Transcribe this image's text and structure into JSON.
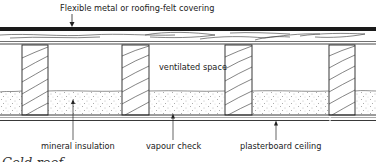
{
  "diagram": {
    "type": "cross-section",
    "labels": {
      "covering": "Flexible metal or roofing-felt covering",
      "ventilated_space": "ventilated space",
      "mineral_insulation": "mineral insulation",
      "vapour_check": "vapour check",
      "plasterboard_ceiling": "plasterboard ceiling"
    },
    "caption": "Cold roof",
    "components": [
      {
        "name": "covering",
        "description": "dark top layer"
      },
      {
        "name": "timber decking",
        "description": "boarding with wood grain"
      },
      {
        "name": "joists",
        "count": 4,
        "description": "hatched timber joists"
      },
      {
        "name": "ventilated space",
        "description": "open void between joists"
      },
      {
        "name": "mineral insulation",
        "description": "stippled layer between joists"
      },
      {
        "name": "vapour check",
        "description": "thin membrane line"
      },
      {
        "name": "plasterboard ceiling",
        "description": "bottom board layer"
      }
    ],
    "colors": {
      "ink": "#222222",
      "covering": "#1a1a1a",
      "background": "#ffffff"
    }
  }
}
